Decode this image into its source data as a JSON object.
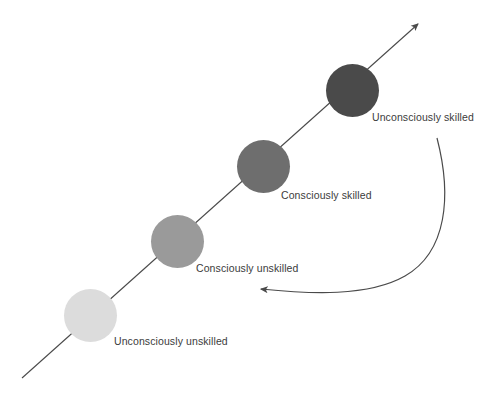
{
  "diagram": {
    "background_color": "#ffffff",
    "line_color": "#4a4a4a",
    "text_color": "#3b3b3b",
    "stages": [
      {
        "id": "unconsciously-unskilled",
        "label": "Unconsciously unskilled",
        "color": "#dcdcdc",
        "cx": 90,
        "cy": 315,
        "r": 26.5,
        "label_x": 114,
        "label_y": 336
      },
      {
        "id": "consciously-unskilled",
        "label": "Consciously unskilled",
        "color": "#9a9a9a",
        "cx": 177,
        "cy": 241,
        "r": 26.5,
        "label_x": 196,
        "label_y": 263
      },
      {
        "id": "consciously-skilled",
        "label": "Consciously skilled",
        "color": "#6e6e6e",
        "cx": 263,
        "cy": 166,
        "r": 26.5,
        "label_x": 281,
        "label_y": 190
      },
      {
        "id": "unconsciously-skilled",
        "label": "Unconsciously skilled",
        "color": "#4a4a4a",
        "cx": 352,
        "cy": 90,
        "r": 26.5,
        "label_x": 372,
        "label_y": 112
      }
    ],
    "progress_arrow": {
      "name": "progression-arrow",
      "from_x": 22,
      "from_y": 378,
      "to_x": 418,
      "to_y": 24,
      "direction": "up-right"
    },
    "regression_arrow": {
      "name": "regression-arrow",
      "from_x": 437,
      "from_y": 138,
      "to_x": 261,
      "to_y": 289,
      "direction": "down-left-curved"
    }
  }
}
